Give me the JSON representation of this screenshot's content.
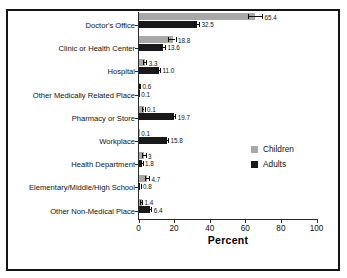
{
  "window": {
    "background": "#ffffff",
    "frame_border_color": "#151515"
  },
  "chart_data": {
    "type": "bar",
    "orientation": "horizontal",
    "title": "",
    "xlabel": "Percent",
    "ylabel": "",
    "xlim": [
      0,
      100
    ],
    "xticks": [
      0,
      20,
      40,
      60,
      80,
      100
    ],
    "grid": false,
    "error_bars": true,
    "legend_position": "right-middle",
    "categories": [
      "Doctor's Office",
      "Clinic or Health Center",
      "Hospital",
      "Other Medically Related Place",
      "Pharmacy or Store",
      "Workplace",
      "Health Department",
      "Elementary/Middle/High School",
      "Other Non-Medical Place"
    ],
    "series": [
      {
        "name": "Children",
        "color": "#a8a8a8",
        "values": [
          65.4,
          18.8,
          3.3,
          0.6,
          2.6,
          0.1,
          3,
          4.7,
          1.4
        ],
        "labels": [
          "65.4",
          "18.8",
          "3.3",
          "0.6",
          "0.1",
          "0.1",
          "3",
          "4.7",
          "1.4"
        ],
        "errors": [
          3.9,
          2.0,
          1.0,
          0.3,
          0.8,
          0.05,
          1.0,
          1.2,
          0.5
        ]
      },
      {
        "name": "Adults",
        "color": "#1a1a1a",
        "values": [
          32.5,
          13.6,
          11.0,
          0.1,
          19.7,
          15.8,
          1.8,
          0.8,
          6.4
        ],
        "labels": [
          "32.5",
          "13.6",
          "11.0",
          "0.1",
          "19.7",
          "15.8",
          "1.8",
          "0.8",
          "6.4"
        ],
        "errors": [
          1.5,
          1.3,
          1.1,
          0.05,
          1.0,
          0.8,
          0.5,
          0.35,
          0.8
        ]
      }
    ],
    "value_labels_children": [
      "65.4",
      "18.8",
      "3.3",
      "0.6",
      "2.6",
      "0.1",
      "3",
      "4.7",
      "1.4"
    ],
    "value_labels_adults": [
      "32.5",
      "13.6",
      "11.0",
      "0.1",
      "19.7",
      "15.8",
      "1.8",
      "0.8",
      "6.4"
    ],
    "legend": {
      "entries": [
        {
          "label": "Children",
          "color": "#a8a8a8"
        },
        {
          "label": "Adults",
          "color": "#1a1a1a"
        }
      ]
    }
  }
}
